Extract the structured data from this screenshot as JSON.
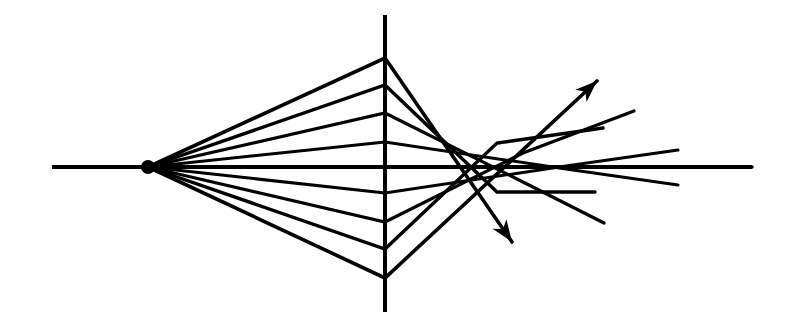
{
  "figure": {
    "kind": "optical-ray-diagram",
    "width": 791,
    "height": 328,
    "background_color": "#ffffff",
    "ink_color": "#000000"
  },
  "chart_data": {
    "type": "line",
    "subtitle": "",
    "xlabel": "",
    "ylabel": "",
    "xlim": [
      0,
      791
    ],
    "ylim": [
      328,
      0
    ],
    "grid": false,
    "legend": "none",
    "annotations": [],
    "axis_line": {
      "name": "optical-axis",
      "x_start": 52,
      "x_end": 752,
      "y": 167,
      "stroke_width": 4
    },
    "lens_plane": {
      "name": "lens-plane",
      "x": 385,
      "y_top": 15,
      "y_bottom": 312,
      "stroke_width": 4
    },
    "source_point": {
      "name": "object-point",
      "x": 148,
      "y": 167,
      "radius": 7
    },
    "rays": [
      {
        "id": "ray-upper-4",
        "label": "marginal ray above axis",
        "has_arrow": true,
        "stroke_width": 3.6,
        "points": [
          [
            148,
            167
          ],
          [
            385,
            58
          ],
          [
            512,
            242
          ]
        ]
      },
      {
        "id": "ray-upper-3",
        "label": "zonal ray above axis",
        "has_arrow": false,
        "stroke_width": 3.4,
        "points": [
          [
            148,
            167
          ],
          [
            385,
            85
          ],
          [
            497,
            192
          ],
          [
            595,
            192
          ]
        ]
      },
      {
        "id": "ray-upper-2",
        "label": "paraxial-zonal ray above axis",
        "has_arrow": false,
        "stroke_width": 3.2,
        "points": [
          [
            148,
            167
          ],
          [
            385,
            113
          ],
          [
            523,
            182
          ],
          [
            604,
            223
          ]
        ]
      },
      {
        "id": "ray-upper-1",
        "label": "paraxial ray above axis",
        "has_arrow": false,
        "stroke_width": 3.0,
        "points": [
          [
            148,
            167
          ],
          [
            385,
            142
          ],
          [
            566,
            169
          ],
          [
            678,
            185
          ]
        ]
      },
      {
        "id": "ray-axial",
        "label": "axial ray along optical axis",
        "has_arrow": false,
        "stroke_width": 3.4,
        "points": [
          [
            148,
            167
          ],
          [
            385,
            167
          ],
          [
            752,
            167
          ]
        ]
      },
      {
        "id": "ray-lower-1",
        "label": "paraxial ray below axis",
        "has_arrow": false,
        "stroke_width": 3.0,
        "points": [
          [
            148,
            167
          ],
          [
            385,
            193
          ],
          [
            566,
            166
          ],
          [
            678,
            150
          ]
        ]
      },
      {
        "id": "ray-lower-2",
        "label": "paraxial-zonal ray below axis",
        "has_arrow": false,
        "stroke_width": 3.2,
        "points": [
          [
            148,
            167
          ],
          [
            385,
            222
          ],
          [
            523,
            153
          ],
          [
            634,
            111
          ]
        ]
      },
      {
        "id": "ray-lower-3",
        "label": "zonal ray below axis",
        "has_arrow": false,
        "stroke_width": 3.4,
        "points": [
          [
            148,
            167
          ],
          [
            385,
            249
          ],
          [
            497,
            143
          ],
          [
            603,
            128
          ]
        ]
      },
      {
        "id": "ray-lower-4",
        "label": "marginal ray below axis",
        "has_arrow": true,
        "stroke_width": 3.6,
        "points": [
          [
            148,
            167
          ],
          [
            385,
            278
          ],
          [
            597,
            81
          ]
        ]
      }
    ],
    "arrowheads": [
      {
        "id": "arrowhead-upper-right",
        "tip_x": 597,
        "tip_y": 81,
        "angle_deg": -42.9,
        "size": 22
      },
      {
        "id": "arrowhead-lower-right",
        "tip_x": 512,
        "tip_y": 242,
        "angle_deg": 55.4,
        "size": 22
      }
    ]
  }
}
